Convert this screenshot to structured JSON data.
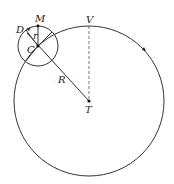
{
  "diagram": {
    "type": "geometry",
    "labels": {
      "D": "D",
      "M": "M",
      "r": "r",
      "C": "C",
      "V": "V",
      "R": "R",
      "T": "T"
    },
    "colors": {
      "stroke": "#333333",
      "text": "#222222",
      "background": "#ffffff"
    },
    "large_circle": {
      "center_label": "T",
      "radius_label": "R"
    },
    "small_circle": {
      "center_label": "C",
      "radius_label": "r"
    }
  }
}
